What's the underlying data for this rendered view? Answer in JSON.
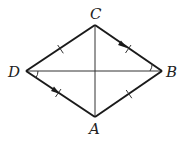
{
  "diagram": {
    "type": "rhombus-with-diagonals",
    "stroke_color": "#1a1a1a",
    "vertices": {
      "C": {
        "label": "C",
        "x": 95,
        "y": 25
      },
      "B": {
        "label": "B",
        "x": 162,
        "y": 71
      },
      "A": {
        "label": "A",
        "x": 95,
        "y": 117
      },
      "D": {
        "label": "D",
        "x": 26,
        "y": 71
      }
    },
    "sides": [
      "DC",
      "CB",
      "BA",
      "AD"
    ],
    "diagonals": [
      "CA",
      "DB"
    ],
    "markings": {
      "tick_marks": [
        "DC",
        "CB",
        "BA",
        "AD"
      ],
      "arrows_parallel": [
        "CB",
        "DA"
      ],
      "angle_arcs": [
        "angle CBD",
        "angle BDA"
      ]
    }
  }
}
